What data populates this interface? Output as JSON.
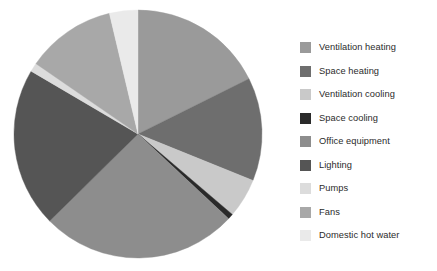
{
  "chart_data": {
    "type": "pie",
    "title": "",
    "subtitle": "",
    "xlabel": "",
    "ylabel": "",
    "grid": false,
    "legend_position": "right",
    "start_angle_deg": 0,
    "direction": "clockwise",
    "categories": [
      "Ventilation heating",
      "Space heating",
      "Ventilation cooling",
      "Space cooling",
      "Office equipment",
      "Lighting",
      "Pumps",
      "Fans",
      "Domestic hot water"
    ],
    "values": [
      17.2,
      13.1,
      5.0,
      0.7,
      25.0,
      20.3,
      1.1,
      11.4,
      3.6
    ],
    "value_unit": "%",
    "angles_deg": [
      61.9,
      47.2,
      18.0,
      2.5,
      90.0,
      73.1,
      4.0,
      41.0,
      13.0
    ],
    "colors": [
      "#9a9a9a",
      "#6e6e6e",
      "#c9c9c9",
      "#2a2a2a",
      "#8d8d8d",
      "#555555",
      "#dcdcdc",
      "#a8a8a8",
      "#eaeaea"
    ]
  },
  "legend": {
    "items": [
      {
        "label": "Ventilation heating",
        "color": "#9a9a9a"
      },
      {
        "label": "Space heating",
        "color": "#6e6e6e"
      },
      {
        "label": "Ventilation cooling",
        "color": "#c9c9c9"
      },
      {
        "label": "Space cooling",
        "color": "#2a2a2a"
      },
      {
        "label": "Office equipment",
        "color": "#8d8d8d"
      },
      {
        "label": "Lighting",
        "color": "#555555"
      },
      {
        "label": "Pumps",
        "color": "#dcdcdc"
      },
      {
        "label": "Fans",
        "color": "#a8a8a8"
      },
      {
        "label": "Domestic hot water",
        "color": "#eaeaea"
      }
    ]
  },
  "geometry": {
    "center_x": 138,
    "center_y": 134,
    "radius": 124
  }
}
